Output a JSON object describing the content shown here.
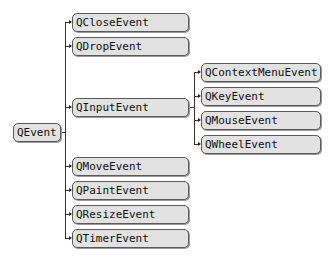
{
  "diagram": {
    "type": "class-hierarchy-tree",
    "root": {
      "label": "QEvent"
    },
    "children": [
      {
        "label": "QCloseEvent"
      },
      {
        "label": "QDropEvent"
      },
      {
        "label": "QInputEvent",
        "children": [
          {
            "label": "QContextMenuEvent"
          },
          {
            "label": "QKeyEvent"
          },
          {
            "label": "QMouseEvent"
          },
          {
            "label": "QWheelEvent"
          }
        ]
      },
      {
        "label": "QMoveEvent"
      },
      {
        "label": "QPaintEvent"
      },
      {
        "label": "QResizeEvent"
      },
      {
        "label": "QTimerEvent"
      }
    ],
    "colors": {
      "node_fill": "#e2e2e2",
      "node_border": "#5a5a5a",
      "connector": "#333333"
    }
  }
}
